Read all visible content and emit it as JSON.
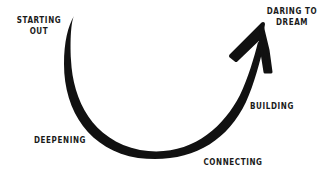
{
  "diagram": {
    "type": "journey-arc",
    "arrow_color": "#111111",
    "background": "#ffffff",
    "stages": [
      {
        "id": "starting-out",
        "lines": [
          "STARTING",
          "OUT"
        ]
      },
      {
        "id": "deepening",
        "lines": [
          "DEEPENING"
        ]
      },
      {
        "id": "connecting",
        "lines": [
          "CONNECTING"
        ]
      },
      {
        "id": "building",
        "lines": [
          "BUILDING"
        ]
      },
      {
        "id": "daring-to-dream",
        "lines": [
          "DARING TO",
          "DREAM"
        ]
      }
    ],
    "arrow": {
      "icon": "curved-arrow-icon",
      "direction": "start top-left, dips down, rises to top-right"
    }
  }
}
